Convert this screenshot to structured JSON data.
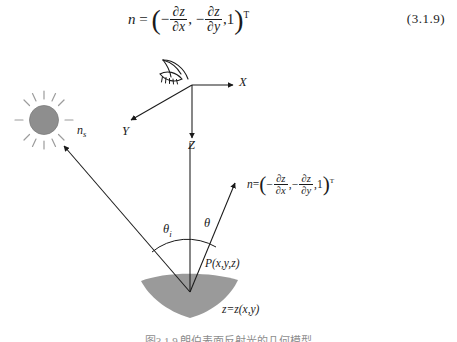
{
  "figure": {
    "caption": "图3.1.9  朗伯表面反射光的几何模型"
  },
  "equation": {
    "lhs": "n",
    "equals": "=",
    "minus": "−",
    "comma": ",",
    "one": "1",
    "transpose": "T",
    "open_paren": "(",
    "close_paren": ")",
    "partial_z": "∂z",
    "partial_x": "∂x",
    "partial_y": "∂y",
    "number": "(3.1.9)"
  },
  "diagram": {
    "axes": {
      "x_label": "X",
      "y_label": "Y",
      "z_label": "Z"
    },
    "labels": {
      "source_normal": "n",
      "source_normal_sub": "s",
      "incidence_angle": "θ",
      "incidence_angle_sub": "i",
      "view_angle": "θ",
      "surface_point": "P(x,y,z)",
      "surface_equation": "z=z(x,y)"
    },
    "icons": {
      "sun": "sun-icon",
      "eye": "eye-icon"
    },
    "colors": {
      "stroke": "#1a1a1a",
      "surface_fill": "#9a9a9a",
      "sun_fill": "#8e8e8e",
      "sun_ray": "#9c9c9c",
      "background": "#ffffff"
    }
  }
}
